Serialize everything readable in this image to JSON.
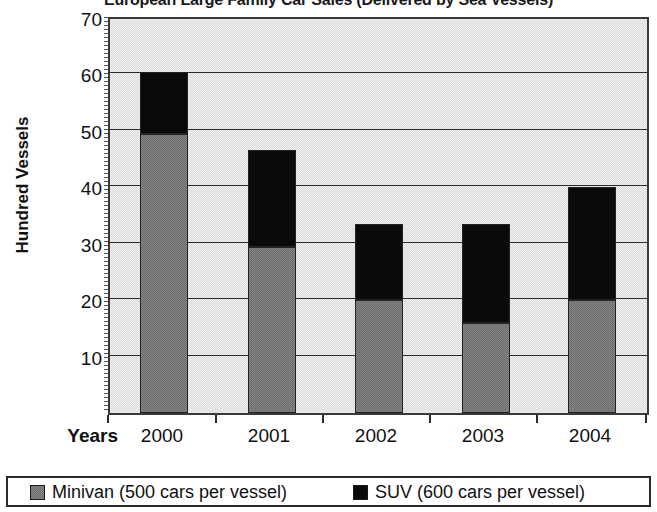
{
  "chart_data": {
    "type": "bar",
    "subtype": "stacked-vertical",
    "title": "European Large Family Car Sales (Delivered by Sea Vessels)",
    "xlabel": "Years",
    "ylabel": "Hundred Vessels",
    "categories": [
      "2000",
      "2001",
      "2002",
      "2003",
      "2004"
    ],
    "ylim": [
      0,
      70
    ],
    "ytick_labels": [
      "70",
      "60",
      "50",
      "40",
      "30",
      "20",
      "10"
    ],
    "ytick_values": [
      70,
      60,
      50,
      40,
      30,
      20,
      10
    ],
    "grid": true,
    "legend_position": "bottom",
    "series": [
      {
        "name": "Minivan (500 cars per vessel)",
        "color": "#6b6b6b",
        "values": [
          49.5,
          29.5,
          20.0,
          16.0,
          20.0
        ]
      },
      {
        "name": "SUV (600 cars per vessel)",
        "color": "#0a0a0a",
        "values": [
          11.0,
          17.2,
          13.5,
          17.5,
          20.0
        ]
      }
    ],
    "totals": [
      60.5,
      46.7,
      33.5,
      33.5,
      40.0
    ]
  },
  "legend": {
    "items": [
      {
        "label": "Minivan (500 cars per vessel)",
        "swatch": "minivan"
      },
      {
        "label": "SUV (600 cars per vessel)",
        "swatch": "suv"
      }
    ]
  },
  "colors": {
    "minivan": "#6b6b6b",
    "suv": "#0a0a0a",
    "plot_background": "#dcdcdc",
    "axis": "#2b2b2b",
    "text": "#111111"
  }
}
